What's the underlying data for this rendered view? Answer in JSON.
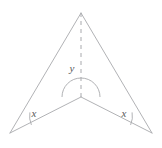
{
  "figure": {
    "type": "geometry-diagram",
    "background_color": "#ffffff",
    "stroke_color": "#a8a9ad",
    "label_color": "#58595b",
    "stroke_width": 0.9,
    "canvas": {
      "width": 162,
      "height": 148
    },
    "points": {
      "apex": {
        "name": "apex",
        "x": 81,
        "y": 13
      },
      "bottom_left": {
        "name": "bottom-left-vertex",
        "x": 10,
        "y": 133
      },
      "bottom_right": {
        "name": "bottom-right-vertex",
        "x": 152,
        "y": 133
      },
      "reflex": {
        "name": "reflex-vertex",
        "x": 81,
        "y": 97
      }
    },
    "edges": [
      {
        "name": "edge-apex-to-bottom-left",
        "from": "apex",
        "to": "bottom_left"
      },
      {
        "name": "edge-apex-to-bottom-right",
        "from": "apex",
        "to": "bottom_right"
      },
      {
        "name": "edge-bottom-left-to-reflex",
        "from": "bottom_left",
        "to": "reflex"
      },
      {
        "name": "edge-bottom-right-to-reflex",
        "from": "bottom_right",
        "to": "reflex"
      }
    ],
    "dashed_axis": {
      "name": "dashed-symmetry-axis",
      "x": 81,
      "y1": 13,
      "y2": 97,
      "dash_pattern": "4 4"
    },
    "angle_marks": [
      {
        "name": "angle-arc-reflex",
        "label": "y",
        "label_x": 72,
        "label_y": 72,
        "vertex": "reflex",
        "radius": 19,
        "kind": "reflex",
        "path": "M 62 97 A 19 19 0 1 1 100 97"
      },
      {
        "name": "angle-arc-bottom-left",
        "label": "x",
        "label_x": 31,
        "label_y": 116,
        "vertex": "bottom_left",
        "radius": 22,
        "kind": "acute",
        "path": "M 29 112 A 22 22 0 0 0 31 126"
      },
      {
        "name": "angle-arc-bottom-right",
        "label": "x",
        "label_x": 120,
        "label_y": 116,
        "vertex": "bottom_right",
        "radius": 22,
        "kind": "acute",
        "path": "M 131 126 A 22 22 0 0 0 133 112"
      }
    ],
    "labels": {
      "reflex_angle": "y",
      "left_base_angle": "x",
      "right_base_angle": "x"
    }
  }
}
